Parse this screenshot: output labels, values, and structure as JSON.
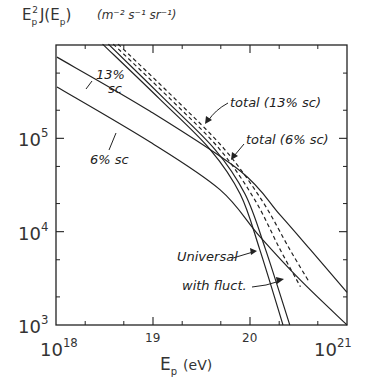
{
  "chart_data": {
    "type": "line",
    "title": "",
    "ylabel": "E_p^2 J(E_p)  (m^-2 s^-1 sr^-1)",
    "ylabel_parts": {
      "main": "E",
      "sub": "p",
      "sup": "2",
      "rest": "J(E",
      "rest_sub": "p",
      "close": ")",
      "units": "(m⁻² s⁻¹ sr⁻¹)"
    },
    "xlabel": "E_p (eV)",
    "xlabel_parts": {
      "main": "E",
      "sub": "p",
      "units": "(eV)"
    },
    "xscale": "log",
    "yscale": "log",
    "xlim_log10": [
      18,
      21
    ],
    "ylim_log10": [
      3,
      6
    ],
    "x_tick_labels": [
      {
        "log": 18,
        "label": "10",
        "sup": "18"
      },
      {
        "log": 19,
        "label": "19"
      },
      {
        "log": 20,
        "label": "20"
      },
      {
        "log": 21,
        "label": "10",
        "sup": "21"
      }
    ],
    "y_tick_labels": [
      {
        "log": 3,
        "label": "10",
        "sup": "3"
      },
      {
        "log": 4,
        "label": "10",
        "sup": "4"
      },
      {
        "log": 5,
        "label": "10",
        "sup": "5"
      }
    ],
    "grid": false,
    "legend": "inline annotations",
    "series": [
      {
        "name": "13% sc",
        "style": "solid",
        "log10_x": [
          18.01,
          18.97,
          19.9,
          20.31,
          20.62,
          21.0
        ],
        "log10_y": [
          5.87,
          5.29,
          4.65,
          4.18,
          3.81,
          3.35
        ]
      },
      {
        "name": "6% sc",
        "style": "solid",
        "log10_x": [
          18.01,
          18.97,
          19.69,
          20.1,
          20.52,
          21.0
        ],
        "log10_y": [
          5.55,
          4.96,
          4.45,
          3.95,
          3.48,
          3.0
        ]
      },
      {
        "name": "Universal",
        "style": "solid",
        "log10_x": [
          18.48,
          19.07,
          19.59,
          19.9,
          20.1,
          20.34
        ],
        "log10_y": [
          6.01,
          5.42,
          4.88,
          4.4,
          3.81,
          3.0
        ]
      },
      {
        "name": "with fluct.",
        "style": "solid",
        "log10_x": [
          18.54,
          19.12,
          19.64,
          19.95,
          20.16,
          20.41
        ],
        "log10_y": [
          6.01,
          5.42,
          4.88,
          4.4,
          3.81,
          3.0
        ]
      },
      {
        "name": "total (6% sc)",
        "style": "dashed",
        "log10_x": [
          18.59,
          19.18,
          19.69,
          20.05,
          20.31,
          20.52
        ],
        "log10_y": [
          6.01,
          5.42,
          4.88,
          4.34,
          3.81,
          3.41
        ]
      },
      {
        "name": "total (13% sc)",
        "style": "dashed",
        "log10_x": [
          18.64,
          19.23,
          19.74,
          20.12,
          20.41,
          20.61
        ],
        "log10_y": [
          6.01,
          5.42,
          4.88,
          4.34,
          3.81,
          3.46
        ]
      }
    ],
    "annotations": [
      {
        "text": "13%",
        "text2": "sc",
        "series": "13% sc"
      },
      {
        "text": "6% sc",
        "series": "6% sc"
      },
      {
        "text": "total (13% sc)",
        "series": "total (13% sc)"
      },
      {
        "text": "total (6% sc)",
        "series": "total (6% sc)"
      },
      {
        "text": "Universal",
        "series": "Universal"
      },
      {
        "text": "with fluct.",
        "series": "with fluct."
      }
    ]
  },
  "colors": {
    "line": "#222222",
    "background": "#ffffff"
  }
}
